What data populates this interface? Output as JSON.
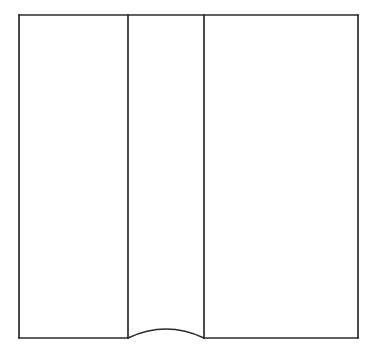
{
  "figure": {
    "type": "line-drawing",
    "canvas": {
      "width": 377,
      "height": 357,
      "background": "#ffffff"
    },
    "stroke": {
      "color": "#2b2b2b",
      "width": 1.7
    },
    "outline": {
      "label": "Outer rectangle",
      "left": 19,
      "top": 15,
      "right": 358,
      "bottom": 338,
      "width": 339,
      "height": 323
    },
    "dividers": [
      {
        "label": "Left divider line",
        "x": 128,
        "y_top": 15,
        "y_bottom": 338
      },
      {
        "label": "Right divider line",
        "x": 204,
        "y_top": 15,
        "y_bottom": 338
      }
    ],
    "arc": {
      "label": "Curved base of centre panel",
      "start_x": 128,
      "start_y": 338,
      "end_x": 204,
      "end_y": 338,
      "apex_x": 166,
      "apex_y": 329,
      "rise": 9,
      "direction": "convex-up"
    },
    "panels": [
      {
        "name": "left-panel",
        "x": 19,
        "width": 109,
        "bottom_shape": "straight"
      },
      {
        "name": "centre-panel",
        "x": 128,
        "width": 76,
        "bottom_shape": "curved-up"
      },
      {
        "name": "right-panel",
        "x": 204,
        "width": 154,
        "bottom_shape": "straight"
      }
    ]
  }
}
